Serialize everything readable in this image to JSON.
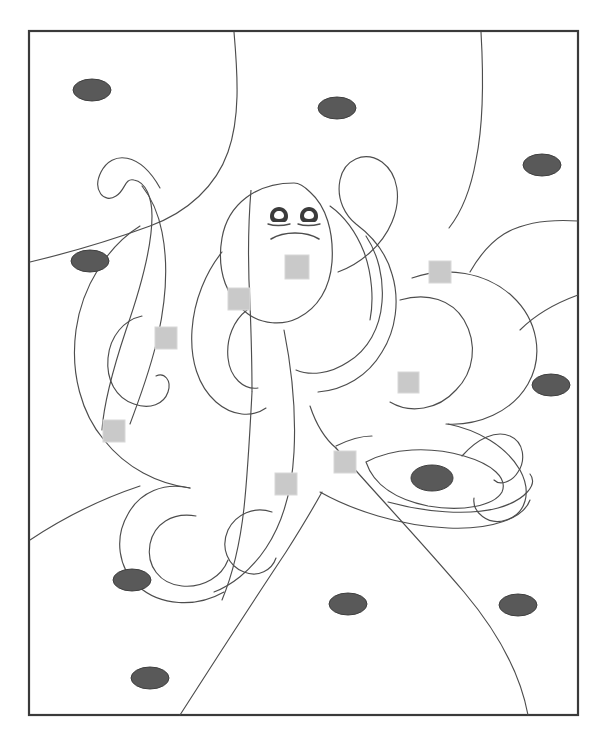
{
  "page": {
    "background_color": "#ffffff",
    "width": 607,
    "height": 742
  },
  "artwork": {
    "kind": "line-art-coloring-page",
    "subject": "octopus underwater",
    "stroke_color": "#4d4d4d",
    "stroke_width": 1.1,
    "fill_color": "#ffffff",
    "frame": {
      "name": "page-border",
      "x": 29,
      "y": 31,
      "width": 549,
      "height": 684,
      "stroke_color": "#3a3a3a",
      "stroke_width": 2.2
    },
    "face": {
      "eye_color": "#3b3b3b",
      "mouth_color": "#4d4d4d",
      "left_eye": {
        "cx": 279,
        "cy": 214,
        "rx": 5.4,
        "ry": 6.2
      },
      "right_eye": {
        "cx": 309,
        "cy": 214,
        "rx": 5.4,
        "ry": 6.2
      },
      "eye_highlight_color": "#ffffff"
    },
    "marker_ellipses": {
      "name": "dark-ellipse-marker",
      "color": "#595959",
      "stroke_color": "#3f3f3f",
      "count": 12,
      "items": [
        {
          "cx": 92,
          "cy": 90,
          "rx": 19,
          "ry": 11
        },
        {
          "cx": 337,
          "cy": 108,
          "rx": 19,
          "ry": 11
        },
        {
          "cx": 542,
          "cy": 165,
          "rx": 19,
          "ry": 11
        },
        {
          "cx": 90,
          "cy": 261,
          "rx": 19,
          "ry": 11
        },
        {
          "cx": 551,
          "cy": 385,
          "rx": 19,
          "ry": 11
        },
        {
          "cx": 432,
          "cy": 478,
          "rx": 21,
          "ry": 13
        },
        {
          "cx": 132,
          "cy": 580,
          "rx": 19,
          "ry": 11
        },
        {
          "cx": 348,
          "cy": 604,
          "rx": 19,
          "ry": 11
        },
        {
          "cx": 518,
          "cy": 605,
          "rx": 19,
          "ry": 11
        },
        {
          "cx": 150,
          "cy": 678,
          "rx": 19,
          "ry": 11
        }
      ]
    },
    "marker_squares": {
      "name": "light-square-marker",
      "color": "#c9c9c9",
      "stroke_color": "#d8d8d8",
      "count": 9,
      "items": [
        {
          "x": 285,
          "y": 255,
          "size": 24
        },
        {
          "x": 429,
          "y": 261,
          "size": 22
        },
        {
          "x": 228,
          "y": 288,
          "size": 22
        },
        {
          "x": 155,
          "y": 327,
          "size": 22
        },
        {
          "x": 398,
          "y": 372,
          "size": 21
        },
        {
          "x": 103,
          "y": 420,
          "size": 22
        },
        {
          "x": 334,
          "y": 451,
          "size": 22
        },
        {
          "x": 275,
          "y": 473,
          "size": 22
        },
        {
          "x": 377,
          "y": 365,
          "size": 0
        }
      ]
    }
  }
}
